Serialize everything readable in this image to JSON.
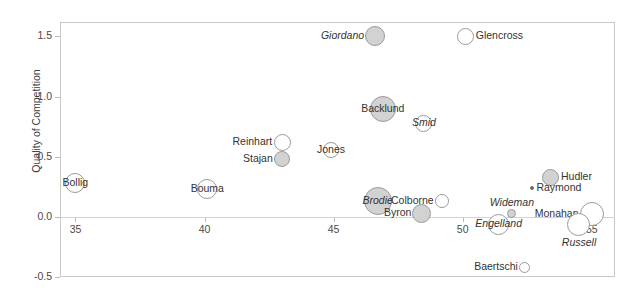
{
  "chart_data": {
    "type": "scatter",
    "title": "",
    "xlabel": "",
    "ylabel": "Quality of Competition",
    "xlim": [
      34.4,
      55.9
    ],
    "ylim": [
      -0.5,
      1.62
    ],
    "xticks": [
      35,
      40,
      45,
      50,
      55
    ],
    "yticks": [
      -0.5,
      0.0,
      0.5,
      1.0,
      1.5
    ],
    "grid": false,
    "legend": "none",
    "note": "Bubble size encodes a third variable; filled gray bubbles and italic labels mark one group, open white bubbles with upright labels mark the other.",
    "points": [
      {
        "name": "Giordano",
        "x": 46.6,
        "y": 1.5,
        "size": 20,
        "fill": "gray",
        "italic": true,
        "label_side": "left"
      },
      {
        "name": "Glencross",
        "x": 50.1,
        "y": 1.5,
        "size": 17,
        "fill": "white",
        "italic": false,
        "label_side": "right"
      },
      {
        "name": "Backlund",
        "x": 46.9,
        "y": 0.9,
        "size": 26,
        "fill": "gray",
        "italic": false,
        "label_side": "center"
      },
      {
        "name": "Smid",
        "x": 48.5,
        "y": 0.78,
        "size": 17,
        "fill": "white",
        "italic": true,
        "label_side": "center"
      },
      {
        "name": "Reinhart",
        "x": 43.0,
        "y": 0.62,
        "size": 17,
        "fill": "white",
        "italic": false,
        "label_side": "left"
      },
      {
        "name": "Stajan",
        "x": 43.0,
        "y": 0.48,
        "size": 16,
        "fill": "gray",
        "italic": false,
        "label_side": "left"
      },
      {
        "name": "Jones",
        "x": 44.9,
        "y": 0.56,
        "size": 16,
        "fill": "white",
        "italic": false,
        "label_side": "center"
      },
      {
        "name": "Hudler",
        "x": 53.4,
        "y": 0.33,
        "size": 17,
        "fill": "gray",
        "italic": false,
        "label_side": "right"
      },
      {
        "name": "Bollig",
        "x": 35.0,
        "y": 0.28,
        "size": 20,
        "fill": "white",
        "italic": false,
        "label_side": "center"
      },
      {
        "name": "Bouma",
        "x": 40.1,
        "y": 0.23,
        "size": 20,
        "fill": "white",
        "italic": false,
        "label_side": "center"
      },
      {
        "name": "Raymond",
        "x": 52.7,
        "y": 0.24,
        "size": 4,
        "fill": "dot",
        "italic": false,
        "label_side": "right"
      },
      {
        "name": "Wideman",
        "x": 51.9,
        "y": 0.03,
        "size": 9,
        "fill": "gray",
        "italic": true,
        "label_side": "above"
      },
      {
        "name": "Brodie",
        "x": 46.7,
        "y": 0.13,
        "size": 28,
        "fill": "gray",
        "italic": true,
        "label_side": "center"
      },
      {
        "name": "Colborne",
        "x": 49.2,
        "y": 0.13,
        "size": 14,
        "fill": "white",
        "italic": false,
        "label_side": "left"
      },
      {
        "name": "Byron",
        "x": 48.4,
        "y": 0.03,
        "size": 19,
        "fill": "gray",
        "italic": false,
        "label_side": "left"
      },
      {
        "name": "Monahan",
        "x": 55.0,
        "y": 0.02,
        "size": 24,
        "fill": "white",
        "italic": false,
        "label_side": "left"
      },
      {
        "name": "Russell",
        "x": 54.5,
        "y": -0.06,
        "size": 23,
        "fill": "white",
        "italic": true,
        "label_side": "below"
      },
      {
        "name": "Engelland",
        "x": 51.4,
        "y": -0.06,
        "size": 21,
        "fill": "white",
        "italic": true,
        "label_side": "center"
      },
      {
        "name": "Baertschi",
        "x": 52.4,
        "y": -0.42,
        "size": 11,
        "fill": "white",
        "italic": false,
        "label_side": "left"
      }
    ]
  },
  "axes": {
    "y_label": "Quality of Competition",
    "y_ticks": [
      "1.5",
      "1.0",
      "0.5",
      "0.0",
      "-0.5"
    ],
    "x_ticks": [
      "35",
      "40",
      "45",
      "50",
      "55"
    ]
  },
  "labels": {
    "giordano": "Giordano",
    "glencross": "Glencross",
    "backlund": "Backlund",
    "smid": "Smid",
    "reinhart": "Reinhart",
    "stajan": "Stajan",
    "jones": "Jones",
    "hudler": "Hudler",
    "bollig": "Bollig",
    "bouma": "Bouma",
    "raymond": "Raymond",
    "wideman": "Wideman",
    "brodie": "Brodie",
    "colborne": "Colborne",
    "byron": "Byron",
    "monahan": "Monahan",
    "russell": "Russell",
    "engelland": "Engelland",
    "baertschi": "Baertschi"
  },
  "colors": {
    "bubble_fill_gray": "#d2d2d2",
    "bubble_fill_white": "#ffffff",
    "bubble_stroke": "#9a9a9a",
    "frame": "#c8c8c8",
    "text": "#333333",
    "grid": "#d2d2d2"
  }
}
